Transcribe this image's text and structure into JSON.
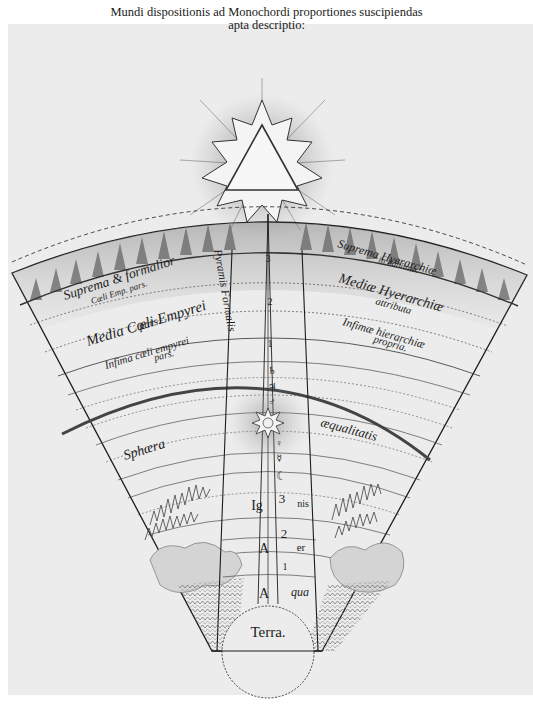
{
  "title": {
    "line1": "Mundi dispositionis ad Monochordi proportiones suscipiendas",
    "line2": "apta descriptio:"
  },
  "colors": {
    "paper": "#ececec",
    "ink": "#1d1d1d",
    "shade": "#8a8a8a",
    "background": "#ffffff"
  },
  "empyrean_left": {
    "suprema": "Suprema & formalior",
    "suprema_sub": "Cœli Emp. pars.",
    "media": "Media Cœli Empyrei",
    "media_sub": "pars.",
    "infima": "Infima cœli empyrei",
    "infima_sub": "pars."
  },
  "empyrean_right": {
    "suprema": "Suprema Hyerarchiæ",
    "suprema_sub": "in habitata.",
    "media": "Mediæ Hyerarchiæ",
    "media_sub": "attributa",
    "infima": "Infimæ hierarchiæ",
    "infima_sub": "propria."
  },
  "pyramid_label": "Pyramis Formalis",
  "sphere_labels": {
    "left": "Sphæra",
    "right": "æqualitatis"
  },
  "column_symbols": [
    "3",
    "2",
    "1",
    "♄",
    "♃",
    "♂",
    "☉",
    "♀",
    "☿",
    "☾",
    "3",
    "2",
    "1"
  ],
  "elements": {
    "fire": [
      "Ig",
      "nis"
    ],
    "air": [
      "A",
      "er"
    ],
    "water": [
      "A",
      "qua"
    ],
    "earth": "Terra."
  },
  "symbols": {
    "trinity": "triangle-icon",
    "sun": "sun-icon"
  }
}
